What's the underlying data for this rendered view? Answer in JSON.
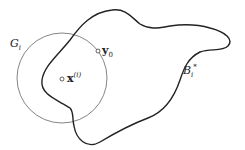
{
  "diagram": {
    "labels": {
      "circle": {
        "main": "G",
        "sub": "i"
      },
      "point_y": {
        "main": "y",
        "sub": "0"
      },
      "point_x": {
        "main": "x",
        "sup": "(i)"
      },
      "region": {
        "main": "B",
        "sub": "i",
        "sup": "*"
      }
    },
    "colors": {
      "circle": "#666666",
      "blob": "#222222",
      "text": "#222222"
    }
  }
}
